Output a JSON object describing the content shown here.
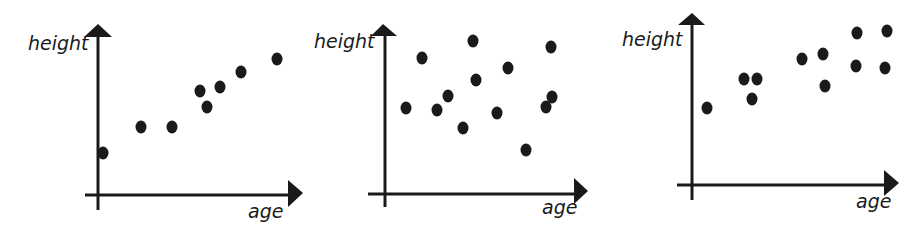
{
  "chart_data": [
    {
      "type": "scatter",
      "title": "",
      "xlabel": "age",
      "ylabel": "height",
      "grid": false,
      "description": "Positive correlation",
      "axis_origin_px": [
        98,
        195
      ],
      "points_px": [
        [
          103,
          153
        ],
        [
          141,
          127
        ],
        [
          172,
          127
        ],
        [
          200,
          91
        ],
        [
          207,
          107
        ],
        [
          220,
          87
        ],
        [
          241,
          72
        ],
        [
          277,
          59
        ]
      ],
      "x": [
        0.3,
        2.2,
        3.7,
        5.1,
        5.4,
        6.1,
        7.1,
        8.9
      ],
      "y": [
        2.5,
        4.1,
        4.1,
        6.3,
        5.3,
        6.5,
        7.5,
        8.3
      ]
    },
    {
      "type": "scatter",
      "title": "",
      "xlabel": "age",
      "ylabel": "height",
      "grid": false,
      "description": "No correlation",
      "axis_origin_px": [
        385,
        194
      ],
      "points_px": [
        [
          406,
          108
        ],
        [
          422,
          58
        ],
        [
          437,
          110
        ],
        [
          448,
          96
        ],
        [
          463,
          128
        ],
        [
          473,
          41
        ],
        [
          476,
          80
        ],
        [
          497,
          113
        ],
        [
          508,
          68
        ],
        [
          526,
          150
        ],
        [
          546,
          107
        ],
        [
          551,
          47
        ],
        [
          552,
          97
        ]
      ],
      "x": [
        1.0,
        1.9,
        2.6,
        3.2,
        3.9,
        4.4,
        4.6,
        5.6,
        6.2,
        7.1,
        8.1,
        8.3,
        8.4
      ],
      "y": [
        5.2,
        8.2,
        5.1,
        5.9,
        4.0,
        9.3,
        6.9,
        4.9,
        7.6,
        2.7,
        5.3,
        9.0,
        5.9
      ]
    },
    {
      "type": "scatter",
      "title": "",
      "xlabel": "age",
      "ylabel": "height",
      "grid": false,
      "description": "Positive correlation (weaker, leveling off)",
      "axis_origin_px": [
        692,
        185
      ],
      "points_px": [
        [
          707,
          108
        ],
        [
          744,
          79
        ],
        [
          757,
          79
        ],
        [
          752,
          99
        ],
        [
          802,
          59
        ],
        [
          823,
          54
        ],
        [
          825,
          86
        ],
        [
          857,
          33
        ],
        [
          856,
          66
        ],
        [
          887,
          31
        ],
        [
          885,
          68
        ]
      ],
      "x": [
        0.8,
        2.6,
        3.3,
        3.0,
        5.5,
        6.6,
        6.7,
        8.3,
        8.2,
        9.8,
        9.7
      ],
      "y": [
        4.7,
        6.4,
        6.4,
        5.2,
        7.6,
        7.9,
        6.0,
        9.2,
        7.2,
        9.3,
        7.1
      ]
    }
  ],
  "labels": {
    "ylabel": "height",
    "xlabel": "age"
  },
  "colors": {
    "ink": "#1a1a1a",
    "background": "#ffffff"
  }
}
